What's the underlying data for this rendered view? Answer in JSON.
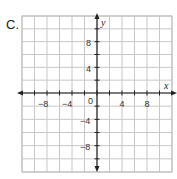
{
  "problem_label": "C.",
  "graph": {
    "x_axis_label": "x",
    "y_axis_label": "y",
    "origin_label": "0",
    "x_tick_labels": [
      "−8",
      "−4",
      "4",
      "8"
    ],
    "y_tick_labels": [
      "8",
      "4",
      "−4",
      "−8"
    ],
    "x_range": [
      -12,
      12
    ],
    "y_range": [
      -12,
      12
    ],
    "grid_step": 2,
    "grid_color": "#c8c8c8",
    "axis_color": "#222222"
  },
  "chart_data": {
    "type": "scatter",
    "title": "",
    "xlabel": "x",
    "ylabel": "y",
    "xlim": [
      -12,
      12
    ],
    "ylim": [
      -12,
      12
    ],
    "grid": true,
    "grid_step": 2,
    "x_ticks_labeled": [
      -8,
      -4,
      4,
      8
    ],
    "y_ticks_labeled": [
      8,
      4,
      -4,
      -8
    ],
    "series": []
  }
}
